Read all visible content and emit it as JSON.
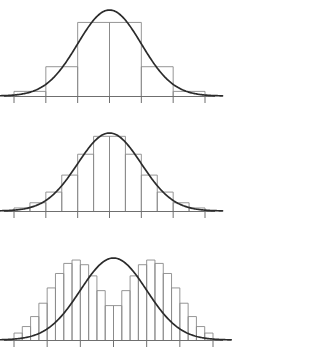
{
  "figure": {
    "title": "",
    "caption": "",
    "background_color": "#ffffff",
    "width": 331,
    "height": 362
  },
  "style": {
    "bar_stroke_color": "#8a8a8a",
    "curve_color": "#2b2b2b",
    "axis_color": "#6f6f6f"
  },
  "chart_data": [
    {
      "type": "bar",
      "id": "panel-top",
      "title": "",
      "subtitle": "",
      "xlabel": "",
      "ylabel": "",
      "grid": false,
      "legend": "none",
      "description": "Histogram with 6 wide bins overlaid by a normal density curve",
      "bin_count": 6,
      "bin_width": 1.0,
      "xlim": [
        -3.0,
        3.0
      ],
      "ylim": [
        0,
        0.42
      ],
      "axis_ticks": [
        -3.0,
        -2.0,
        -1.0,
        0.0,
        1.0,
        2.0,
        3.0
      ],
      "tick_labels": [
        "",
        "",
        "",
        "",
        "",
        "",
        ""
      ],
      "bin_edges": [
        -3.0,
        -2.0,
        -1.0,
        0.0,
        1.0,
        2.0,
        3.0
      ],
      "categories": [
        "-2.5",
        "-1.5",
        "-0.5",
        "0.5",
        "1.5",
        "2.5"
      ],
      "values": [
        0.0214,
        0.1359,
        0.3413,
        0.3413,
        0.1359,
        0.0214
      ],
      "curve": {
        "name": "normal-density",
        "mean": 0,
        "sd": 1,
        "peak": 0.3989
      }
    },
    {
      "type": "bar",
      "id": "panel-middle",
      "title": "",
      "subtitle": "",
      "xlabel": "",
      "ylabel": "",
      "grid": false,
      "legend": "none",
      "description": "Histogram with 12 medium bins overlaid by the same normal density curve",
      "bin_count": 12,
      "bin_width": 0.5,
      "xlim": [
        -3.0,
        3.0
      ],
      "ylim": [
        0,
        0.42
      ],
      "axis_ticks": [
        -3.0,
        -2.0,
        -1.0,
        0.0,
        1.0,
        2.0,
        3.0
      ],
      "tick_labels": [
        "",
        "",
        "",
        "",
        "",
        "",
        ""
      ],
      "bin_edges": [
        -3.0,
        -2.5,
        -2.0,
        -1.5,
        -1.0,
        -0.5,
        0.0,
        0.5,
        1.0,
        1.5,
        2.0,
        2.5,
        3.0
      ],
      "categories": [
        "-2.75",
        "-2.25",
        "-1.75",
        "-1.25",
        "-0.75",
        "-0.25",
        "0.25",
        "0.75",
        "1.25",
        "1.75",
        "2.25",
        "2.75"
      ],
      "values": [
        0.0115,
        0.0312,
        0.0716,
        0.1359,
        0.2149,
        0.2827,
        0.2827,
        0.2149,
        0.1359,
        0.0716,
        0.0312,
        0.0115
      ],
      "curve": {
        "name": "normal-density",
        "mean": 0,
        "sd": 1,
        "peak": 0.3989
      }
    },
    {
      "type": "bar",
      "id": "panel-bottom",
      "title": "",
      "subtitle": "",
      "xlabel": "",
      "ylabel": "",
      "grid": false,
      "legend": "none",
      "description": "Histogram with 24 narrow bins closely tracing the normal density curve",
      "bin_count": 24,
      "bin_width": 0.25,
      "xlim": [
        -3.0,
        3.0
      ],
      "ylim": [
        0,
        0.42
      ],
      "axis_ticks": [
        -3.0,
        -2.0,
        -1.0,
        0.0,
        1.0,
        2.0,
        3.0
      ],
      "tick_labels": [
        "",
        "",
        "",
        "",
        "",
        "",
        ""
      ],
      "bin_edges": [
        -3.0,
        -2.75,
        -2.5,
        -2.25,
        -2.0,
        -1.75,
        -1.5,
        -1.25,
        -1.0,
        -0.75,
        -0.5,
        -0.25,
        0.0,
        0.25,
        0.5,
        0.75,
        1.0,
        1.25,
        1.5,
        1.75,
        2.0,
        2.25,
        2.5,
        2.75,
        3.0
      ],
      "categories": [
        "-2.875",
        "-2.625",
        "-2.375",
        "-2.125",
        "-1.875",
        "-1.625",
        "-1.375",
        "-1.125",
        "-0.875",
        "-0.625",
        "-0.375",
        "-0.125",
        "0.125",
        "0.375",
        "0.625",
        "0.875",
        "1.125",
        "1.375",
        "1.625",
        "1.875",
        "2.125",
        "2.375",
        "2.625",
        "2.875"
      ],
      "values": [
        0.008,
        0.0155,
        0.027,
        0.0424,
        0.06,
        0.0766,
        0.0883,
        0.0921,
        0.0868,
        0.0739,
        0.0569,
        0.0396,
        0.0396,
        0.0569,
        0.0739,
        0.0868,
        0.0921,
        0.0883,
        0.0766,
        0.06,
        0.0424,
        0.027,
        0.0155,
        0.008
      ],
      "values_density": [
        0.0064,
        0.0124,
        0.0216,
        0.0339,
        0.048,
        0.0613,
        0.0706,
        0.0737,
        0.0694,
        0.0591,
        0.0455,
        0.0317,
        0.0317,
        0.0455,
        0.0591,
        0.0694,
        0.0737,
        0.0706,
        0.0613,
        0.048,
        0.0339,
        0.0216,
        0.0124,
        0.0064
      ],
      "curve": {
        "name": "normal-density",
        "mean": 0,
        "sd": 1,
        "peak": 0.3989
      }
    }
  ]
}
